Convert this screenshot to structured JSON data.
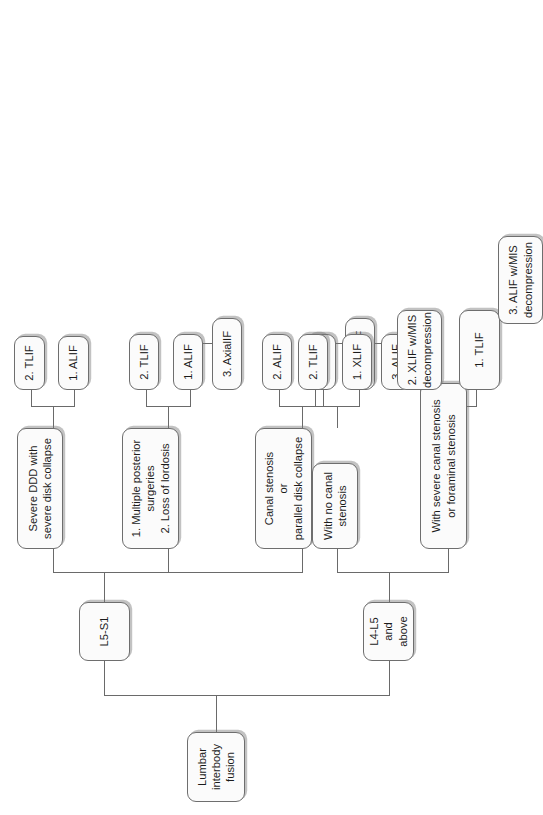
{
  "figure": {
    "type": "flowchart",
    "orientation": "rotated-90-counterclockwise",
    "colors": {
      "node_fill": "#fbfbfb",
      "node_border": "#6e6e6e",
      "connector": "#6a6a6a",
      "text": "#1b1b1b",
      "background": "#ffffff"
    }
  },
  "nodes": {
    "root": "Lumbar\ninterbody\nfusion",
    "level1": {
      "l5s1": "L5-S1",
      "l4l5": "L4-L5\nand above"
    },
    "l5s1_children": {
      "severe_ddd": "Severe DDD with\nsevere disk collapse",
      "multiple_posterior": "1. Multiple posterior\nsurgeries\n2. Loss of lordosis",
      "canal_stenosis": "Canal stenosis\nor\nparallel disk collapse"
    },
    "severe_ddd_options": {
      "opt1": "1. ALIF",
      "opt2": "2. TLIF"
    },
    "multiple_posterior_options": {
      "opt1": "1. ALIF",
      "opt2": "2. TLIF",
      "opt3": "3. AxialIF"
    },
    "canal_stenosis_options": {
      "opt1": "1. TLIF",
      "opt2": "2. ALIF",
      "opt3": "3. AxialIF"
    },
    "l4l5_children": {
      "no_canal_stenosis": "With no canal\nstenosis",
      "severe_canal_stenosis": "With severe canal stenosis\nor foraminal stenosis"
    },
    "no_canal_stenosis_options": {
      "opt1": "1. XLIF",
      "opt2": "2. TLIF",
      "opt3": "3. ALIF"
    },
    "severe_canal_stenosis_options": {
      "opt1": "1. TLIF",
      "opt2": "2. XLIF w/MIS\ndecompression",
      "opt3": "3. ALIF w/MIS\ndecompression"
    }
  }
}
